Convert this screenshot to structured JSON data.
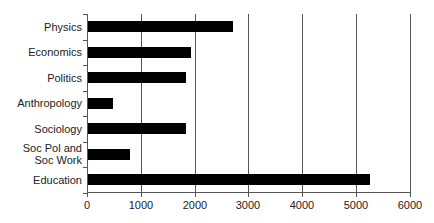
{
  "chart_data": {
    "type": "bar",
    "orientation": "horizontal",
    "title": "",
    "xlabel": "",
    "ylabel": "",
    "categories": [
      "Physics",
      "Economics",
      "Politics",
      "Anthropology",
      "Sociology",
      "Soc Pol and Soc Work",
      "Education"
    ],
    "category_lines": [
      [
        "Physics"
      ],
      [
        "Economics"
      ],
      [
        "Politics"
      ],
      [
        "Anthropology"
      ],
      [
        "Sociology"
      ],
      [
        "Soc Pol and",
        "Soc Work"
      ],
      [
        "Education"
      ]
    ],
    "values": [
      2700,
      1910,
      1830,
      460,
      1830,
      780,
      5240
    ],
    "xlim": [
      0,
      6000
    ],
    "xticks": [
      "0",
      "1000",
      "2000",
      "3000",
      "4000",
      "5000",
      "6000"
    ],
    "grid": "vertical",
    "legend": null,
    "bar_color": "#000000"
  }
}
